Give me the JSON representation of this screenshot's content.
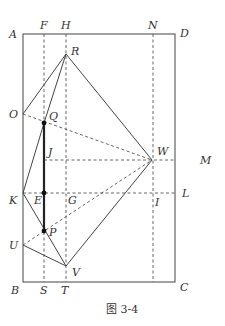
{
  "figure": {
    "caption": "图 3-4",
    "colors": {
      "line": "#444444",
      "thick_line": "#222222",
      "dashed": "#555555",
      "dot": "#111111",
      "background": "#ffffff"
    },
    "rectangle": {
      "corners": [
        "A",
        "D",
        "C",
        "B"
      ]
    },
    "points": {
      "A": {
        "label": "A",
        "x": 23,
        "y": 34
      },
      "D": {
        "label": "D",
        "x": 175,
        "y": 34
      },
      "B": {
        "label": "B",
        "x": 23,
        "y": 282
      },
      "C": {
        "label": "C",
        "x": 175,
        "y": 282
      },
      "F": {
        "label": "F",
        "x": 44,
        "y": 34
      },
      "H": {
        "label": "H",
        "x": 66,
        "y": 34
      },
      "N": {
        "label": "N",
        "x": 153,
        "y": 34
      },
      "R": {
        "label": "R",
        "x": 66,
        "y": 54
      },
      "O": {
        "label": "O",
        "x": 23,
        "y": 114
      },
      "Q": {
        "label": "Q",
        "x": 44,
        "y": 123
      },
      "J": {
        "label": "J",
        "x": 44,
        "y": 160
      },
      "W": {
        "label": "W",
        "x": 152,
        "y": 160
      },
      "M": {
        "label": "M",
        "x": 175,
        "y": 160
      },
      "K": {
        "label": "K",
        "x": 23,
        "y": 193
      },
      "E": {
        "label": "E",
        "x": 44,
        "y": 193
      },
      "G": {
        "label": "G",
        "x": 66,
        "y": 193
      },
      "I": {
        "label": "I",
        "x": 153,
        "y": 193
      },
      "L": {
        "label": "L",
        "x": 175,
        "y": 193
      },
      "P": {
        "label": "P",
        "x": 44,
        "y": 231
      },
      "U": {
        "label": "U",
        "x": 23,
        "y": 245
      },
      "V": {
        "label": "V",
        "x": 66,
        "y": 266
      },
      "S": {
        "label": "S",
        "x": 44,
        "y": 282
      },
      "T": {
        "label": "T",
        "x": 66,
        "y": 282
      }
    },
    "solid_segments": [
      [
        "R",
        "O"
      ],
      [
        "R",
        "Q"
      ],
      [
        "Q",
        "K"
      ],
      [
        "R",
        "W"
      ],
      [
        "W",
        "V"
      ],
      [
        "V",
        "U"
      ],
      [
        "K",
        "V"
      ]
    ],
    "thick_segments": [
      [
        "Q",
        "P"
      ]
    ],
    "dashed_segments": [
      [
        "F",
        "S"
      ],
      [
        "H",
        "T"
      ],
      [
        "N",
        "I"
      ],
      [
        "I",
        "C_bottom"
      ],
      [
        "O",
        "W"
      ],
      [
        "U",
        "W"
      ],
      [
        "J",
        "M"
      ],
      [
        "K",
        "L"
      ]
    ],
    "marked_points": [
      "Q",
      "E",
      "P"
    ]
  }
}
